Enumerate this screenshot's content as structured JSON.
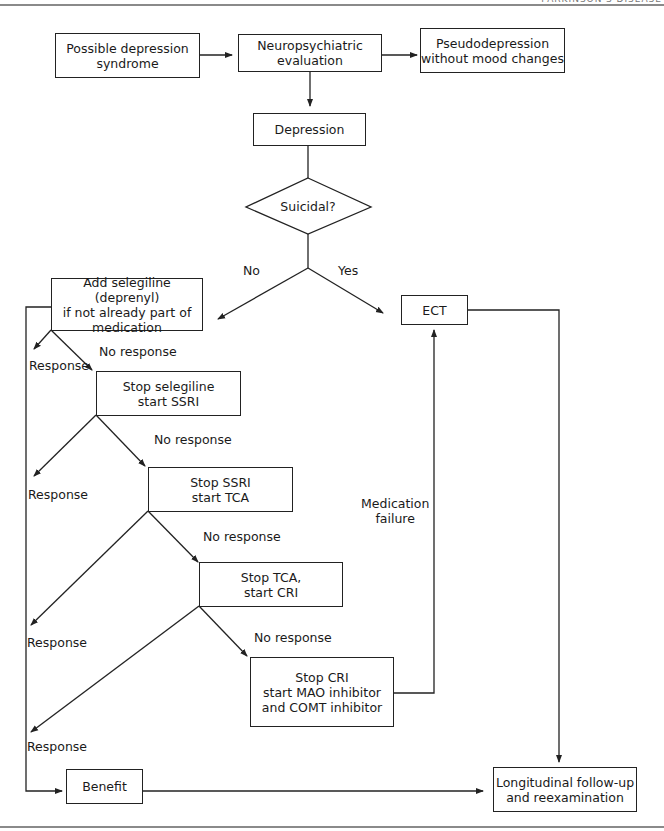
{
  "header": {
    "text": "PARKINSON'S DISEASE"
  },
  "flowchart": {
    "nodes": {
      "possible_depression": "Possible depression\nsyndrome",
      "neuro_eval": "Neuropsychiatric\nevaluation",
      "pseudodepression": "Pseudodepression\nwithout mood changes",
      "depression": "Depression",
      "suicidal": "Suicidal?",
      "add_selegiline": "Add selegiline (deprenyl)\nif not already part of\nmedication",
      "ect": "ECT",
      "stop_selegiline": "Stop selegiline\nstart SSRI",
      "stop_ssri": "Stop SSRI\nstart TCA",
      "stop_tca": "Stop TCA,\nstart CRI",
      "stop_cri": "Stop CRI\nstart MAO inhibitor\nand COMT inhibitor",
      "benefit": "Benefit",
      "followup": "Longitudinal follow-up\nand reexamination"
    },
    "edge_labels": {
      "no": "No",
      "yes": "Yes",
      "response_1": "Response",
      "no_response_1": "No response",
      "response_2": "Response",
      "no_response_2": "No response",
      "no_response_3": "No response",
      "response_3": "Response",
      "no_response_4": "No response",
      "response_4": "Response",
      "medication_failure": "Medication\nfailure"
    },
    "colors": {
      "line": "#222222",
      "background": "#ffffff",
      "rule": "#8a8a8a"
    }
  }
}
